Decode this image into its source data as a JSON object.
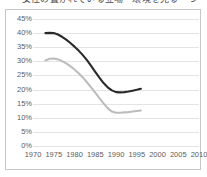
{
  "caption": {
    "text": "女性の置かれている立場・環境を見る一つ"
  },
  "frame": {
    "border_color": "#c8c8c8",
    "background": "#ffffff"
  },
  "chart_data": {
    "type": "line",
    "title": "",
    "subtitle": "",
    "xlabel": "",
    "ylabel": "",
    "grid": "horizontal",
    "legend": "none",
    "xlim": [
      1970,
      2010
    ],
    "ylim": [
      0,
      45
    ],
    "xticks": [
      1970,
      1975,
      1980,
      1985,
      1990,
      1995,
      2000,
      2005,
      2010
    ],
    "xtick_labels": [
      "1970",
      "1975",
      "1980",
      "1985",
      "1990",
      "1995",
      "2000",
      "2005",
      "2010"
    ],
    "yticks": [
      0,
      5,
      10,
      15,
      20,
      25,
      30,
      35,
      40,
      45
    ],
    "ytick_labels": [
      "0%",
      "5%",
      "10%",
      "15%",
      "20%",
      "25%",
      "30%",
      "35%",
      "40%",
      "45%"
    ],
    "series": [
      {
        "name": "series-dark",
        "color": "#2a2a2a",
        "width": 2.1,
        "x": [
          1973,
          1974,
          1975,
          1976,
          1977,
          1978,
          1979,
          1980,
          1981,
          1982,
          1983,
          1984,
          1985,
          1986,
          1987,
          1988,
          1989,
          1990,
          1991,
          1992,
          1993,
          1994,
          1995,
          1996
        ],
        "values": [
          40.0,
          40.1,
          40.0,
          39.5,
          38.7,
          37.7,
          36.5,
          35.2,
          33.8,
          32.2,
          30.4,
          28.4,
          26.3,
          24.2,
          22.3,
          20.8,
          19.7,
          19.1,
          19.0,
          19.1,
          19.3,
          19.6,
          19.9,
          20.3
        ]
      },
      {
        "name": "series-light",
        "color": "#bdbdbd",
        "width": 2.1,
        "x": [
          1973,
          1974,
          1975,
          1976,
          1977,
          1978,
          1979,
          1980,
          1981,
          1982,
          1983,
          1984,
          1985,
          1986,
          1987,
          1988,
          1989,
          1990,
          1991,
          1992,
          1993,
          1994,
          1995,
          1996
        ],
        "values": [
          30.3,
          30.9,
          31.0,
          30.7,
          30.1,
          29.3,
          28.3,
          27.1,
          25.8,
          24.3,
          22.6,
          20.8,
          18.9,
          17.0,
          15.1,
          13.4,
          12.2,
          11.8,
          11.8,
          11.9,
          12.0,
          12.2,
          12.4,
          12.6
        ]
      }
    ]
  }
}
